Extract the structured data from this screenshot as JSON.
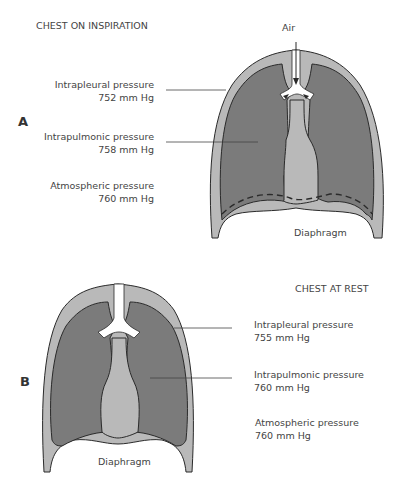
{
  "panel_a": {
    "letter": "A",
    "title": "CHEST ON INSPIRATION",
    "air_label": "Air",
    "intrapleural": {
      "name": "Intrapleural pressure",
      "value": "752 mm Hg"
    },
    "intrapulmonic": {
      "name": "Intrapulmonic pressure",
      "value": "758 mm Hg"
    },
    "atmospheric": {
      "name": "Atmospheric pressure",
      "value": "760 mm Hg"
    },
    "diaphragm_label": "Diaphragm"
  },
  "panel_b": {
    "letter": "B",
    "title": "CHEST AT REST",
    "intrapleural": {
      "name": "Intrapleural pressure",
      "value": "755 mm Hg"
    },
    "intrapulmonic": {
      "name": "Intrapulmonic pressure",
      "value": "760 mm Hg"
    },
    "atmospheric": {
      "name": "Atmospheric pressure",
      "value": "760 mm Hg"
    },
    "diaphragm_label": "Diaphragm"
  },
  "colors": {
    "lung": "#7b7b7b",
    "pleura": "#b9b9b9",
    "outline": "#2a2a2a",
    "airway": "#ffffff"
  }
}
